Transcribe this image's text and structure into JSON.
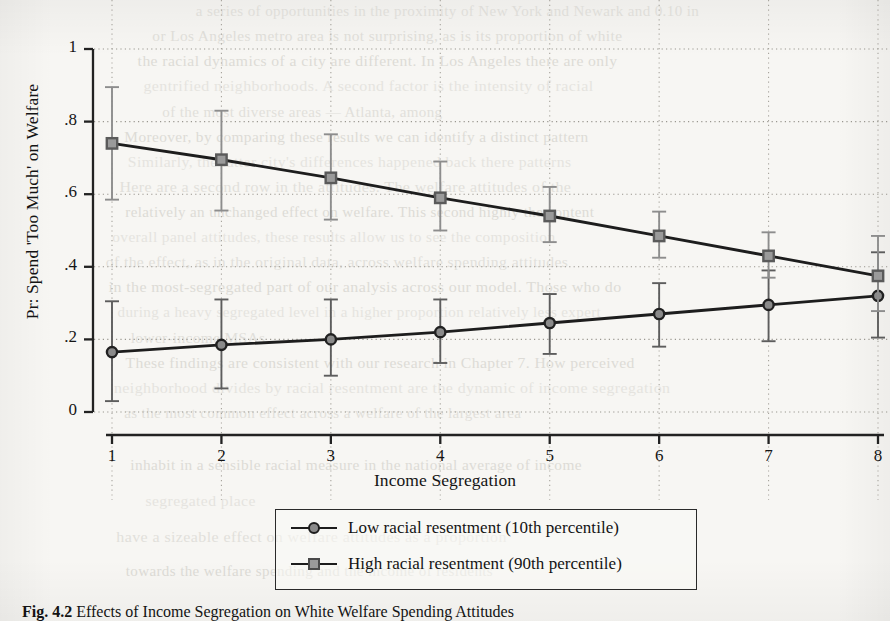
{
  "page": {
    "background_color": "#f7f6f3",
    "ink_color": "#141414"
  },
  "figure": {
    "caption_label": "Fig. 4.2",
    "caption_text": " Effects of Income Segregation on White Welfare Spending Attitudes"
  },
  "legend": {
    "entries": [
      {
        "marker": "circle-marker",
        "label": "Low racial resentment (10th percentile)"
      },
      {
        "marker": "square-marker",
        "label": "High racial resentment (90th percentile)"
      }
    ]
  },
  "axes": {
    "x_title": "Income Segregation",
    "y_title": "Pr: Spend 'Too Much' on Welfare",
    "x_ticks": [
      "1",
      "2",
      "3",
      "4",
      "5",
      "6",
      "7",
      "8"
    ],
    "y_ticks": [
      "0",
      ".2",
      ".4",
      ".6",
      ".8",
      "1"
    ]
  },
  "bleed_through": [
    {
      "x": 188,
      "y": 2,
      "text": "a series of opportunities in the proximity of New York and Newark and 0.10 in"
    },
    {
      "x": 150,
      "y": 27,
      "text": "or Los Angeles metro area is not surprising, as is its proportion of white"
    },
    {
      "x": 140,
      "y": 52,
      "text": "the racial dynamics of a city are different. In Los Angeles there are only"
    },
    {
      "x": 150,
      "y": 77,
      "text": "gentrified neighborhoods. A second factor is the intensity of racial"
    },
    {
      "x": 158,
      "y": 103,
      "text": "of the most diverse areas — Atlanta, among"
    },
    {
      "x": 122,
      "y": 128,
      "text": "Moreover, by comparing these results we can identify a distinct pattern"
    },
    {
      "x": 130,
      "y": 153,
      "text": "Similarly, the latter city's differences happened back there patterns"
    },
    {
      "x": 126,
      "y": 178,
      "text": "Here are a second row in the attitudes. The welfare attitudes of the"
    },
    {
      "x": 118,
      "y": 203,
      "text": "relatively an unchanged effect on welfare. This second highly the content"
    },
    {
      "x": 110,
      "y": 228,
      "text": "overall panel attitudes, these results allow us to see the composition"
    },
    {
      "x": 108,
      "y": 253,
      "text": "of the effect, as in the original data, across welfare spending attitudes"
    },
    {
      "x": 116,
      "y": 278,
      "text": "in the most-segregated part of our analysis across our model. Those who do"
    },
    {
      "x": 110,
      "y": 303,
      "text": "during a heavy segregated level in a higher proportion relatively less expert"
    },
    {
      "x": 130,
      "y": 329,
      "text": "lower-income MSAs"
    },
    {
      "x": 128,
      "y": 354,
      "text": "These findings are consistent with our research in Chapter 7. How perceived"
    },
    {
      "x": 122,
      "y": 379,
      "text": "neighborhood divides by racial resentment are the dynamic of income segregation"
    },
    {
      "x": 118,
      "y": 404,
      "text": "as the most common effect across a welfare of the largest area"
    },
    {
      "x": 128,
      "y": 456,
      "text": "inhabit in a sensible racial measure in the national average of income"
    },
    {
      "x": 146,
      "y": 492,
      "text": "segregated place"
    },
    {
      "x": 122,
      "y": 528,
      "text": "have a sizeable effect on welfare attitudes as a proportion"
    },
    {
      "x": 120,
      "y": 562,
      "text": "towards the welfare spending and the income of residents"
    }
  ],
  "chart_data": {
    "type": "line",
    "title": "",
    "xlabel": "Income Segregation",
    "ylabel": "Pr: Spend 'Too Much' on Welfare",
    "x": [
      1,
      2,
      3,
      4,
      5,
      6,
      7,
      8
    ],
    "xlim": [
      0.72,
      8.28
    ],
    "ylim": [
      0,
      1
    ],
    "grid": true,
    "grid_style": "dotted",
    "legend_position": "below-axes",
    "series": [
      {
        "name": "Low racial resentment (10th percentile)",
        "marker": "circle",
        "marker_fill": "#8a8a8a",
        "line_color": "#1d1d1d",
        "values": [
          0.165,
          0.185,
          0.2,
          0.22,
          0.245,
          0.27,
          0.295,
          0.32
        ],
        "ci_low": [
          0.03,
          0.065,
          0.1,
          0.135,
          0.16,
          0.18,
          0.195,
          0.205
        ],
        "ci_high": [
          0.305,
          0.31,
          0.31,
          0.31,
          0.325,
          0.355,
          0.39,
          0.44
        ]
      },
      {
        "name": "High racial resentment (90th percentile)",
        "marker": "square",
        "marker_fill": "#9a9a9a",
        "line_color": "#1d1d1d",
        "values": [
          0.74,
          0.695,
          0.645,
          0.59,
          0.54,
          0.485,
          0.43,
          0.375
        ],
        "ci_low": [
          0.585,
          0.555,
          0.53,
          0.5,
          0.468,
          0.425,
          0.37,
          0.278
        ],
        "ci_high": [
          0.895,
          0.83,
          0.765,
          0.69,
          0.62,
          0.552,
          0.495,
          0.485
        ]
      }
    ]
  }
}
